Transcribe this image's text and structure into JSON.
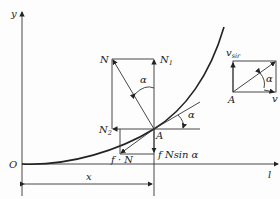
{
  "figure": {
    "labels": {
      "y_axis": "y",
      "x_axis": "l",
      "origin": "O",
      "dimension_x": "x",
      "point_A": "A",
      "force_N": "N",
      "force_N1": "N",
      "force_N1_sub": "1",
      "force_N2": "N",
      "force_N2_sub": "2",
      "friction": "f · N",
      "friction_vertical": "f Nsin α",
      "angle_1": "α",
      "angle_2": "α",
      "angle_3": "α",
      "velocity_rect_A": "A",
      "velocity_v": "v",
      "velocity_vsir": "v",
      "velocity_vsir_sub": "sir"
    },
    "colors": {
      "line": "#333333",
      "curve": "#222222",
      "background": "#fdfdfd"
    }
  }
}
